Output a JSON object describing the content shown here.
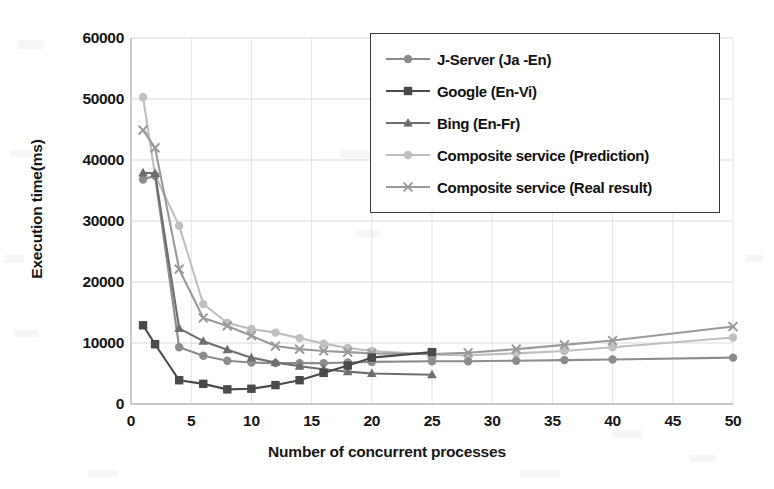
{
  "chart_data": {
    "type": "line",
    "title": "",
    "xlabel": "Number of concurrent processes",
    "ylabel": "Execution time(ms)",
    "xlim": [
      0,
      50
    ],
    "ylim": [
      0,
      60000
    ],
    "xticks": [
      0,
      5,
      10,
      15,
      20,
      25,
      30,
      35,
      40,
      45,
      50
    ],
    "yticks": [
      0,
      10000,
      20000,
      30000,
      40000,
      50000,
      60000
    ],
    "grid": true,
    "legend_position": "top-right",
    "series": [
      {
        "name": "J-Server (Ja -En)",
        "marker": "circle",
        "color": "#8c8c8c",
        "points": [
          [
            1,
            36800
          ],
          [
            2,
            37400
          ],
          [
            4,
            9300
          ],
          [
            6,
            7900
          ],
          [
            8,
            7100
          ],
          [
            10,
            6800
          ],
          [
            12,
            6700
          ],
          [
            14,
            6700
          ],
          [
            16,
            6700
          ],
          [
            18,
            6800
          ],
          [
            20,
            6900
          ],
          [
            25,
            7000
          ],
          [
            28,
            7000
          ],
          [
            32,
            7100
          ],
          [
            36,
            7200
          ],
          [
            40,
            7300
          ],
          [
            50,
            7600
          ]
        ]
      },
      {
        "name": "Google (En-Vi)",
        "marker": "square",
        "color": "#4a4a4a",
        "points": [
          [
            1,
            12900
          ],
          [
            2,
            9800
          ],
          [
            4,
            3900
          ],
          [
            6,
            3300
          ],
          [
            8,
            2400
          ],
          [
            10,
            2500
          ],
          [
            12,
            3100
          ],
          [
            14,
            3900
          ],
          [
            16,
            5100
          ],
          [
            18,
            6300
          ],
          [
            20,
            7600
          ],
          [
            25,
            8500
          ]
        ]
      },
      {
        "name": "Bing (En-Fr)",
        "marker": "triangle",
        "color": "#6e6e6e",
        "points": [
          [
            1,
            37900
          ],
          [
            2,
            37800
          ],
          [
            4,
            12400
          ],
          [
            6,
            10300
          ],
          [
            8,
            8900
          ],
          [
            10,
            7600
          ],
          [
            12,
            6800
          ],
          [
            14,
            6200
          ],
          [
            16,
            5700
          ],
          [
            18,
            5300
          ],
          [
            20,
            5000
          ],
          [
            25,
            4800
          ]
        ]
      },
      {
        "name": "Composite service (Prediction)",
        "marker": "circle",
        "color": "#bfbfbf",
        "points": [
          [
            1,
            50300
          ],
          [
            2,
            37500
          ],
          [
            4,
            29200
          ],
          [
            6,
            16400
          ],
          [
            8,
            13300
          ],
          [
            10,
            12300
          ],
          [
            12,
            11700
          ],
          [
            14,
            10800
          ],
          [
            16,
            9900
          ],
          [
            18,
            9200
          ],
          [
            20,
            8700
          ],
          [
            25,
            8100
          ],
          [
            28,
            8000
          ],
          [
            32,
            8300
          ],
          [
            36,
            8700
          ],
          [
            40,
            9300
          ],
          [
            50,
            10900
          ]
        ]
      },
      {
        "name": "Composite service (Real result)",
        "marker": "x",
        "color": "#9a9a9a",
        "points": [
          [
            1,
            44900
          ],
          [
            2,
            42000
          ],
          [
            4,
            22100
          ],
          [
            6,
            14100
          ],
          [
            8,
            12800
          ],
          [
            10,
            11200
          ],
          [
            12,
            9500
          ],
          [
            14,
            9000
          ],
          [
            16,
            8700
          ],
          [
            18,
            8500
          ],
          [
            20,
            8300
          ],
          [
            25,
            8200
          ],
          [
            28,
            8400
          ],
          [
            32,
            9000
          ],
          [
            36,
            9700
          ],
          [
            40,
            10400
          ],
          [
            50,
            12700
          ]
        ]
      }
    ]
  },
  "legend": {
    "items": [
      {
        "label": "J-Server (Ja -En)"
      },
      {
        "label": "Google (En-Vi)"
      },
      {
        "label": "Bing (En-Fr)"
      },
      {
        "label": "Composite service (Prediction)"
      },
      {
        "label": "Composite service (Real result)"
      }
    ]
  },
  "axes": {
    "y_title": "Execution time(ms)",
    "x_title": "Number of concurrent processes",
    "y_tick_labels": [
      "0",
      "10000",
      "20000",
      "30000",
      "40000",
      "50000",
      "60000"
    ],
    "x_tick_labels": [
      "0",
      "5",
      "10",
      "15",
      "20",
      "25",
      "30",
      "35",
      "40",
      "45",
      "50"
    ]
  }
}
